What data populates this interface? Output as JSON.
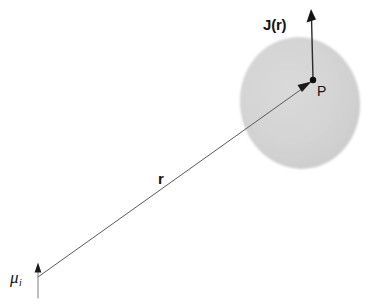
{
  "figure": {
    "domain_type": "physics-vector-diagram",
    "width": 375,
    "height": 306,
    "background_color": "#ffffff"
  },
  "region": {
    "name": "current-density-region",
    "shape": "ellipse",
    "fill_color": "#d4d4d4",
    "center_x": 300,
    "center_y": 103,
    "radius_x": 60,
    "radius_y": 66,
    "rotation_deg": -8
  },
  "labels": {
    "current_density": "J(r)",
    "position_vector": "r",
    "field_point": "P",
    "magnetic_moment": "μ",
    "magnetic_moment_subscript": "i"
  },
  "vectors": [
    {
      "name": "position-vector-r",
      "label": "r",
      "from_x": 38,
      "from_y": 277,
      "to_x": 311,
      "to_y": 82,
      "stroke_color": "#555555",
      "stroke_width": 1,
      "arrowhead": "filled-at-tip",
      "label_x": 158,
      "label_y": 171
    },
    {
      "name": "current-density-vector-J",
      "label": "J(r)",
      "from_x": 313,
      "from_y": 80,
      "to_x": 311,
      "to_y": 10,
      "stroke_color": "#222222",
      "stroke_width": 1.4,
      "arrowhead": "filled-at-tip",
      "label_x": 263,
      "label_y": 24
    },
    {
      "name": "magnetic-moment-arrow",
      "label": "μi",
      "from_x": 38,
      "from_y": 297,
      "to_x": 38,
      "to_y": 263,
      "stroke_color": "#777777",
      "stroke_width": 1,
      "arrowhead": "filled-at-tip",
      "label_x": 9,
      "label_y": 270
    }
  ],
  "points": [
    {
      "name": "field-point-P",
      "label": "P",
      "x": 313,
      "y": 80,
      "radius": 3.2,
      "color": "#0d0d0d",
      "label_x": 316,
      "label_y": 83
    }
  ]
}
